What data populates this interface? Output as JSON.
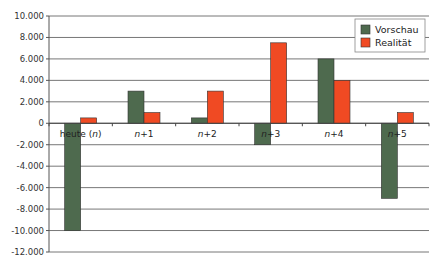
{
  "chart_data": {
    "type": "bar",
    "title": "",
    "xlabel": "",
    "ylabel": "",
    "categories": [
      "heute (n)",
      "n+1",
      "n+2",
      "n+3",
      "n+4",
      "n+5"
    ],
    "series": [
      {
        "name": "Vorschau",
        "color": "#4e6a4e",
        "values": [
          -10000,
          3000,
          500,
          -2000,
          6000,
          -7000
        ]
      },
      {
        "name": "Realität",
        "color": "#f04a23",
        "values": [
          500,
          1000,
          3000,
          7500,
          4000,
          1000
        ]
      }
    ],
    "ylim": [
      -12000,
      10000
    ],
    "yticks": [
      10000,
      8000,
      6000,
      4000,
      2000,
      0,
      -2000,
      -4000,
      -6000,
      -8000,
      -10000,
      -12000
    ],
    "ytick_labels": [
      "10.000",
      "8.000",
      "6.000",
      "4.000",
      "2.000",
      "0",
      "-2.000",
      "-4.000",
      "-6.000",
      "-8.000",
      "-10.000",
      "-12.000"
    ],
    "grid": true,
    "legend_position": "upper right"
  },
  "legend": {
    "items": [
      {
        "label": "Vorschau",
        "color": "#4e6a4e"
      },
      {
        "label": "Realität",
        "color": "#f04a23"
      }
    ]
  }
}
